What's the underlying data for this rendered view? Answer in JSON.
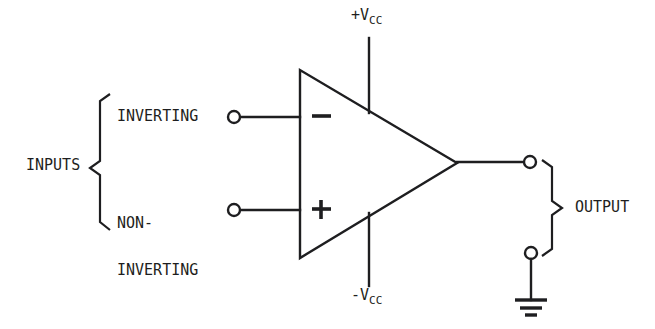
{
  "diagram": {
    "background_color": "#ffffff",
    "line_color": "#1e1e20",
    "labels": {
      "inputs": "INPUTS",
      "inverting": "INVERTING",
      "noninverting_line1": "NON-",
      "noninverting_line2": "INVERTING",
      "output": "OUTPUT",
      "supply_positive_main": "+V",
      "supply_positive_sub": "CC",
      "supply_negative_main": "-V",
      "supply_negative_sub": "CC",
      "inverting_terminal_sign": "−",
      "noninverting_terminal_sign": "+"
    },
    "geometry": {
      "triangle": {
        "left_x": 300,
        "top_y": 70,
        "bottom_y": 258,
        "apex_x": 457,
        "apex_y": 163
      },
      "inverting_terminal": {
        "cx": 234,
        "cy": 117,
        "r": 6
      },
      "noninverting_terminal": {
        "cx": 234,
        "cy": 210,
        "r": 6
      },
      "output_terminal": {
        "cx": 530,
        "cy": 162,
        "r": 6
      },
      "ground_terminal": {
        "cx": 531,
        "cy": 253,
        "r": 6
      },
      "supply_line_x": 369,
      "supply_positive_span": [
        38,
        113
      ],
      "supply_negative_span": [
        213,
        286
      ],
      "ground_bars": [
        {
          "y": 300,
          "half_width": 16
        },
        {
          "y": 308,
          "half_width": 11
        },
        {
          "y": 315,
          "half_width": 6
        }
      ]
    }
  }
}
